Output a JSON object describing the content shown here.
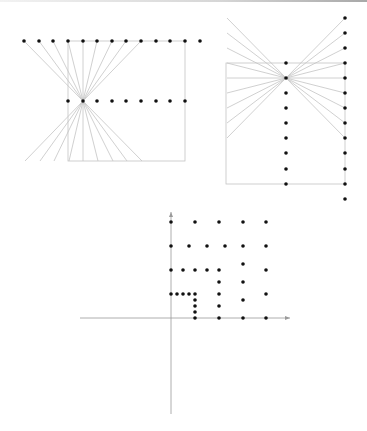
{
  "colors": {
    "line": "#c4c4c4",
    "dot": "#111111",
    "axis": "#9a9a9a",
    "topbar": "#b0b0b0"
  },
  "figures": [
    {
      "id": "fan-horizontal",
      "description": "Rows of points with rays from top row through center point, and a rectangle",
      "top_row": {
        "y": 41,
        "xs": [
          24,
          39,
          53,
          68,
          83,
          97,
          112,
          126,
          141,
          156,
          170,
          185,
          200
        ]
      },
      "middle_row": {
        "y": 101,
        "xs": [
          68,
          83,
          97,
          112,
          126,
          141,
          156,
          170,
          185
        ]
      },
      "center": [
        83,
        101
      ],
      "box": {
        "x1": 68,
        "y1": 41,
        "x2": 185,
        "y2": 161
      },
      "ray_sources_x": [
        24,
        39,
        53,
        68,
        83,
        97,
        112,
        126,
        141
      ],
      "ray_source_y": 41
    },
    {
      "id": "fan-vertical",
      "description": "Columns of points with rays from right column through center point, and a rectangle",
      "right_col": {
        "x": 345,
        "ys": [
          18,
          33,
          48,
          63,
          78,
          93,
          108,
          123,
          138,
          153,
          169,
          184,
          199
        ]
      },
      "middle_col": {
        "x": 286,
        "ys": [
          63,
          78,
          93,
          108,
          123,
          138,
          153,
          169,
          184
        ]
      },
      "center": [
        286,
        78
      ],
      "box": {
        "x1": 226,
        "y1": 63,
        "x2": 345,
        "y2": 184
      },
      "ray_sources_y": [
        18,
        33,
        48,
        63,
        78,
        93,
        108,
        123,
        138
      ],
      "ray_source_x": 345
    },
    {
      "id": "lattice-axes",
      "description": "Coordinate axes with lattice of points at dyadic subdivisions",
      "origin": [
        171,
        318
      ],
      "x_axis": {
        "from": 80,
        "to": 290
      },
      "y_axis": {
        "from": 414,
        "to": 212
      },
      "points": [
        [
          171,
          222
        ],
        [
          195,
          222
        ],
        [
          219,
          222
        ],
        [
          243,
          222
        ],
        [
          266,
          222
        ],
        [
          171,
          246
        ],
        [
          189,
          246
        ],
        [
          207,
          246
        ],
        [
          225,
          246
        ],
        [
          243,
          246
        ],
        [
          266,
          246
        ],
        [
          171,
          270
        ],
        [
          183,
          270
        ],
        [
          195,
          270
        ],
        [
          207,
          270
        ],
        [
          219,
          270
        ],
        [
          243,
          264
        ],
        [
          266,
          270
        ],
        [
          219,
          282
        ],
        [
          243,
          282
        ],
        [
          171,
          294
        ],
        [
          177,
          294
        ],
        [
          183,
          294
        ],
        [
          189,
          294
        ],
        [
          195,
          294
        ],
        [
          219,
          294
        ],
        [
          266,
          294
        ],
        [
          195,
          300
        ],
        [
          243,
          300
        ],
        [
          195,
          306
        ],
        [
          219,
          306
        ],
        [
          195,
          312
        ],
        [
          195,
          318
        ],
        [
          219,
          318
        ],
        [
          243,
          318
        ],
        [
          266,
          318
        ]
      ]
    }
  ]
}
